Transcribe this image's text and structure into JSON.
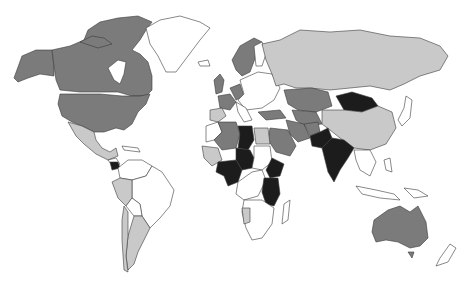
{
  "map": {
    "type": "choropleth",
    "projection": "world",
    "palette": {
      "none": "#ffffff",
      "low": "#c9c9c9",
      "medium": "#7b7b7b",
      "high": "#1c1c1c"
    },
    "legend_visible": false,
    "regions": [
      {
        "name": "Canada",
        "level": "medium"
      },
      {
        "name": "United States",
        "level": "medium"
      },
      {
        "name": "Alaska",
        "level": "medium"
      },
      {
        "name": "Greenland",
        "level": "none"
      },
      {
        "name": "Mexico",
        "level": "low"
      },
      {
        "name": "Panama",
        "level": "high"
      },
      {
        "name": "Brazil",
        "level": "none"
      },
      {
        "name": "Peru",
        "level": "low"
      },
      {
        "name": "Argentina",
        "level": "low"
      },
      {
        "name": "Chile",
        "level": "low"
      },
      {
        "name": "Russia",
        "level": "low"
      },
      {
        "name": "Kazakhstan",
        "level": "medium"
      },
      {
        "name": "Mongolia",
        "level": "high"
      },
      {
        "name": "China",
        "level": "low"
      },
      {
        "name": "India",
        "level": "high"
      },
      {
        "name": "Pakistan",
        "level": "high"
      },
      {
        "name": "Iran",
        "level": "medium"
      },
      {
        "name": "Saudi Arabia",
        "level": "medium"
      },
      {
        "name": "Scandinavia",
        "level": "medium"
      },
      {
        "name": "United Kingdom",
        "level": "medium"
      },
      {
        "name": "Spain",
        "level": "low"
      },
      {
        "name": "France",
        "level": "medium"
      },
      {
        "name": "Eastern Europe",
        "level": "none"
      },
      {
        "name": "Algeria",
        "level": "medium"
      },
      {
        "name": "Libya",
        "level": "high"
      },
      {
        "name": "Egypt",
        "level": "low"
      },
      {
        "name": "Chad",
        "level": "high"
      },
      {
        "name": "Nigeria",
        "level": "high"
      },
      {
        "name": "Ethiopia",
        "level": "high"
      },
      {
        "name": "Kenya",
        "level": "high"
      },
      {
        "name": "Tanzania",
        "level": "high"
      },
      {
        "name": "Namibia",
        "level": "low"
      },
      {
        "name": "Southern Africa",
        "level": "none"
      },
      {
        "name": "Australia",
        "level": "medium"
      },
      {
        "name": "New Zealand",
        "level": "none"
      },
      {
        "name": "Southeast Asia",
        "level": "none"
      },
      {
        "name": "Japan",
        "level": "none"
      }
    ]
  }
}
